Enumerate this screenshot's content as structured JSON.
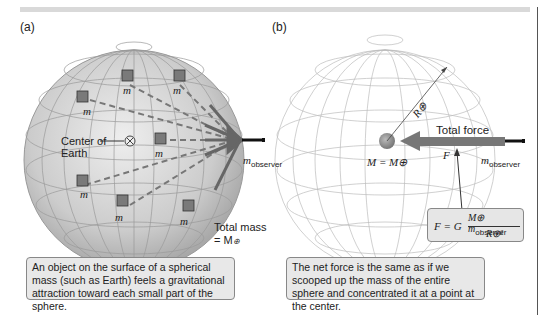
{
  "panel_a": {
    "label": "(a)",
    "mass_label": "m",
    "center_label_line1": "Center of",
    "center_label_line2": "Earth",
    "observer_label": "m",
    "observer_sub": "observer",
    "total_mass_line1": "Total mass",
    "total_mass_line2": "= M",
    "earth_symbol": "⊕",
    "caption": "An object on the surface of a spherical mass (such as Earth) feels a gravitational attraction toward each small part of the sphere."
  },
  "panel_b": {
    "label": "(b)",
    "radius_label": "R⊕",
    "total_force_label": "Total force",
    "force_symbol": "F",
    "mass_equation": "M = M⊕",
    "observer_label": "m",
    "observer_sub": "observer",
    "formula": {
      "lhs": "F = G",
      "numerator_M": "M⊕",
      "numerator_m": "m",
      "numerator_sub": "observer",
      "denominator": "R⊕²"
    },
    "caption": "The net force is the same as if we scooped up the mass of the entire sphere and concentrated it at a point at the center."
  },
  "colors": {
    "sphere_fill": "#c8c8c8",
    "arrow": "#777777",
    "caption_bg": "#e8e8e8",
    "grid": "#bbbbbb"
  }
}
